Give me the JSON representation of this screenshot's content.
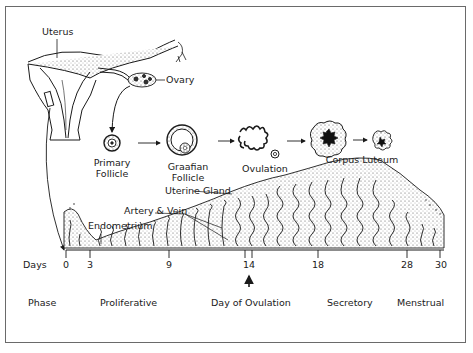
{
  "anatomy_labels": {
    "uterus": "Uterus",
    "ovary": "Ovary"
  },
  "ovarian_stages": [
    {
      "id": "primary-follicle",
      "line1": "Primary",
      "line2": "Follicle"
    },
    {
      "id": "graafian-follicle",
      "line1": "Graafian",
      "line2": "Follicle"
    },
    {
      "id": "ovulation",
      "line1": "Ovulation",
      "line2": ""
    },
    {
      "id": "corpus-luteum",
      "line1": "Corpus Luteum",
      "line2": ""
    }
  ],
  "endometrium_labels": {
    "uterine_gland": "Uterine Gland",
    "artery_vein": "Artery & Vein",
    "endometrium": "Endometrium"
  },
  "days_axis": {
    "label": "Days",
    "ticks": [
      "0",
      "3",
      "9",
      "14",
      "18",
      "28",
      "30"
    ]
  },
  "phase_row": {
    "label": "Phase",
    "phases": [
      "Proliferative",
      "Day of Ovulation",
      "Secretory",
      "Menstrual"
    ]
  },
  "colors": {
    "ink": "#1a1a1a",
    "frame": "#6a6a6a",
    "stipple": "#bdbdbd",
    "background": "#ffffff"
  }
}
